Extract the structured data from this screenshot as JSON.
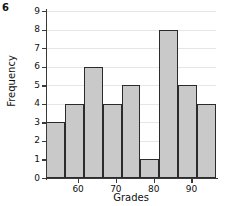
{
  "figure_number": "6",
  "chart_data": {
    "type": "bar",
    "title": "",
    "xlabel": "Grades",
    "ylabel": "Frequency",
    "categories": [
      "50-55",
      "55-60",
      "60-65",
      "65-70",
      "70-75",
      "75-80",
      "80-85",
      "85-90",
      "90-95"
    ],
    "bin_edges": [
      51.5,
      56.5,
      61.5,
      66.5,
      71.5,
      76.5,
      81.5,
      86.5,
      91.5,
      96.5
    ],
    "values": [
      3,
      4,
      6,
      4,
      5,
      1,
      8,
      5,
      4
    ],
    "ylim": [
      0,
      9
    ],
    "xlim": [
      51.5,
      96.5
    ],
    "y_ticks": [
      0,
      1,
      2,
      3,
      4,
      5,
      6,
      7,
      8,
      9
    ],
    "y_tick_labels": [
      "0",
      "1",
      "2",
      "3",
      "4",
      "5",
      "6",
      "7",
      "8",
      "9"
    ],
    "x_ticks": [
      60,
      70,
      80,
      90
    ],
    "x_tick_labels": [
      "60",
      "70",
      "80",
      "90"
    ],
    "grid": true,
    "legend": false,
    "bar_fill_color": "#c9c9c9",
    "bar_edge_color": "#2b2b2b",
    "gridline_color": "#e6e6e6",
    "axis_color": "#3a3a3a"
  }
}
